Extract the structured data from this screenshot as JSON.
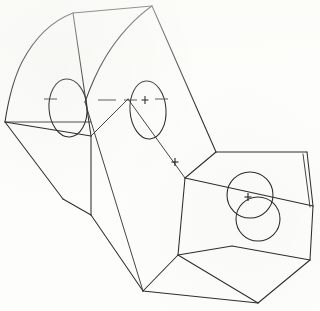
{
  "drawing": {
    "title": "Isometric line drawing of a two-block bracket part",
    "view": "isometric",
    "width": 320,
    "height": 311,
    "background_color": "#fdfdfb",
    "line_color": "#2e2e30",
    "line_weight": 1.05,
    "style": "monochrome scanned engineering sketch"
  },
  "geometry": {
    "left_block": {
      "name": "curved-top-left-block",
      "description": "Tall block whose upper face is a circular-arc sector, carrying two elliptical through-holes",
      "outer_arc": "M 73 13 C 42 26 16 70 5 122",
      "inner_arc": "M 152 6 C 128 26 104 62 88 100",
      "top_edge": "M 73 13 L 152 6",
      "edges": [
        "M 5 122 L 90 136",
        "M 5 122 L 63 199",
        "M 63 199 L 90 215",
        "M 90 136 L 90 215",
        "M 73 13 L 90 136",
        "M 90 215 L 143 291",
        "M 152 6 L 216 152"
      ]
    },
    "right_block": {
      "name": "flat-top-right-block",
      "description": "Lower right prism whose top face carries two overlapping circular holes",
      "edges": [
        "M 216 152 L 307 152",
        "M 216 152 L 185 178",
        "M 185 178 L 313 206",
        "M 307 152 L 313 206",
        "M 313 206 L 310 260",
        "M 310 260 L 258 303",
        "M 258 303 L 143 291",
        "M 185 178 L 178 255",
        "M 178 255 L 258 303",
        "M 178 255 L 143 291",
        "M 310 260 L 232 246",
        "M 232 246 L 178 255"
      ]
    }
  },
  "features": {
    "holes": [
      {
        "name": "elliptical-hole-left",
        "shape": "ellipse",
        "cx": 68,
        "cy": 108,
        "rx": 19,
        "ry": 29,
        "rotation": -4,
        "has_center_mark": false
      },
      {
        "name": "elliptical-hole-right",
        "shape": "ellipse",
        "cx": 148,
        "cy": 110,
        "rx": 18,
        "ry": 29,
        "rotation": -4,
        "has_center_mark": true
      },
      {
        "name": "circular-hole-upper",
        "shape": "circle",
        "cx": 250,
        "cy": 195,
        "r": 23,
        "has_center_mark": true
      },
      {
        "name": "circular-hole-lower",
        "shape": "circle",
        "cx": 258,
        "cy": 219,
        "r": 22,
        "has_center_mark": false
      }
    ],
    "center_marks": [
      {
        "name": "center-mark-right-ellipse",
        "x": 145,
        "y": 100,
        "size": 6
      },
      {
        "name": "center-mark-mid-face",
        "x": 175,
        "y": 162,
        "size": 6
      },
      {
        "name": "center-mark-upper-circle",
        "x": 248,
        "y": 197,
        "size": 6
      }
    ],
    "centerlines": [
      {
        "name": "centerline-dash-a",
        "x1": 44,
        "y1": 99,
        "x2": 57,
        "y2": 99
      },
      {
        "name": "centerline-dash-b",
        "x1": 98,
        "y1": 100,
        "x2": 116,
        "y2": 100
      },
      {
        "name": "centerline-dash-c",
        "x1": 124,
        "y1": 100,
        "x2": 137,
        "y2": 100
      },
      {
        "name": "centerline-dash-d",
        "x1": 155,
        "y1": 99,
        "x2": 168,
        "y2": 99
      }
    ]
  }
}
